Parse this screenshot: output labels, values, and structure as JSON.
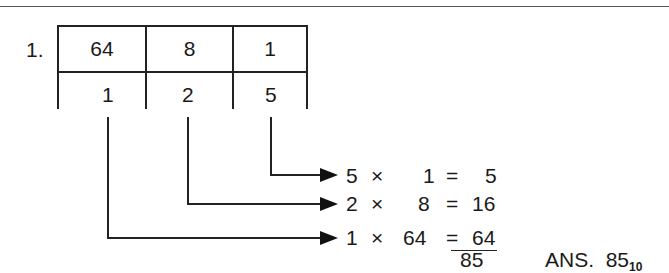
{
  "problem": {
    "number": "1.",
    "place_values": [
      "64",
      "8",
      "1"
    ],
    "digits": [
      "1",
      "2",
      "5"
    ]
  },
  "products": [
    {
      "digit": "5",
      "times": "×",
      "place": "1",
      "equals": "=",
      "result": "5"
    },
    {
      "digit": "2",
      "times": "×",
      "place": "8",
      "equals": "=",
      "result": "16"
    },
    {
      "digit": "1",
      "times": "×",
      "place": "64",
      "equals": "=",
      "result": "64"
    }
  ],
  "sum": "85",
  "answer": {
    "label": "ANS.",
    "value": "85",
    "base": "10"
  }
}
